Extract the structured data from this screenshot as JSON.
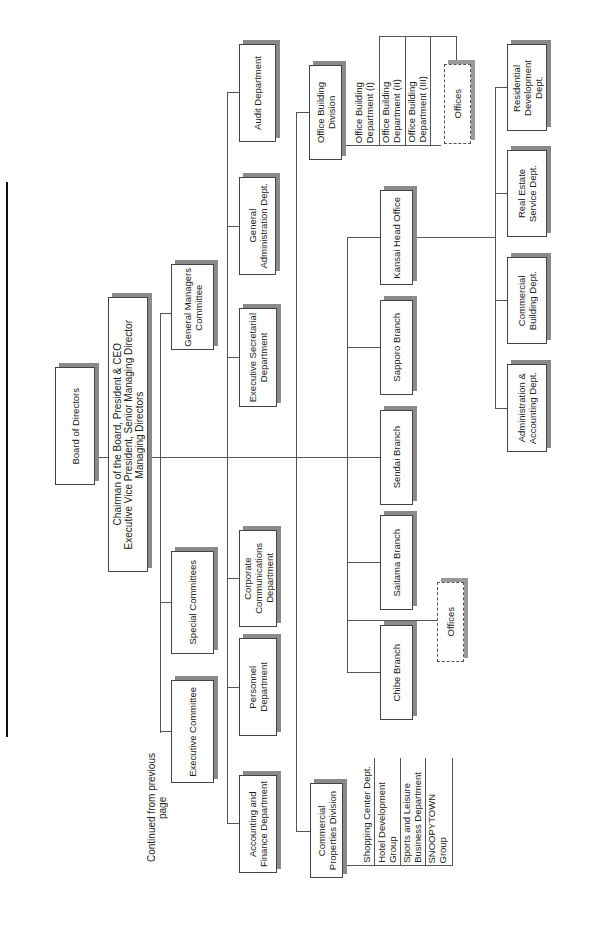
{
  "header": {
    "continued_label": "Continued from previous page"
  },
  "org_chart": {
    "board": "Board of Directors",
    "executives": "Chairman of the Board, President & CEO\nExecutive Vice President, Senior Managing Director\nManaging Directors",
    "committees": [
      {
        "label": "General Managers\nCommittee"
      },
      {
        "label": "Special Committees"
      },
      {
        "label": "Executive Committee"
      }
    ],
    "departments": [
      {
        "label": "Audit Department"
      },
      {
        "label": "General\nAdministration Dept."
      },
      {
        "label": "Executive Secretarial\nDepartment"
      },
      {
        "label": "Corporate\nCommunications\nDepartment"
      },
      {
        "label": "Personnel\nDepartment"
      },
      {
        "label": "Accounting and\nFinance Department"
      }
    ],
    "office_building_division": {
      "label": "Office Building\nDivision",
      "sub_departments": [
        {
          "label": "Office Building\nDepartment (I)"
        },
        {
          "label": "Office Building\nDepartment  (II)"
        },
        {
          "label": "Office Building\nDepartment (III)"
        }
      ],
      "offices": "Offices"
    },
    "commercial_properties_division": {
      "label": "Commercial\nProperties Division",
      "sub_departments": [
        {
          "label": "Shopping Center Dept."
        },
        {
          "label": "Hotel Development\nGroup"
        },
        {
          "label": "Sports and Leisure\nBusiness Department"
        },
        {
          "label": "SNOOPYTOWN\nGroup"
        }
      ]
    },
    "branches": [
      {
        "label": "Kansai Head Office"
      },
      {
        "label": "Sapporo Branch"
      },
      {
        "label": "Sendai Branch"
      },
      {
        "label": "Saitama Branch"
      },
      {
        "label": "Chibe Branch"
      }
    ],
    "branch_offices": "Offices",
    "kansai_departments": [
      {
        "label": "Residential\nDevelopment\nDept."
      },
      {
        "label": "Real Estate\nService Dept."
      },
      {
        "label": "Commercial\nBuilding Dept."
      },
      {
        "label": "Administration &\nAccounting Dept."
      }
    ]
  }
}
